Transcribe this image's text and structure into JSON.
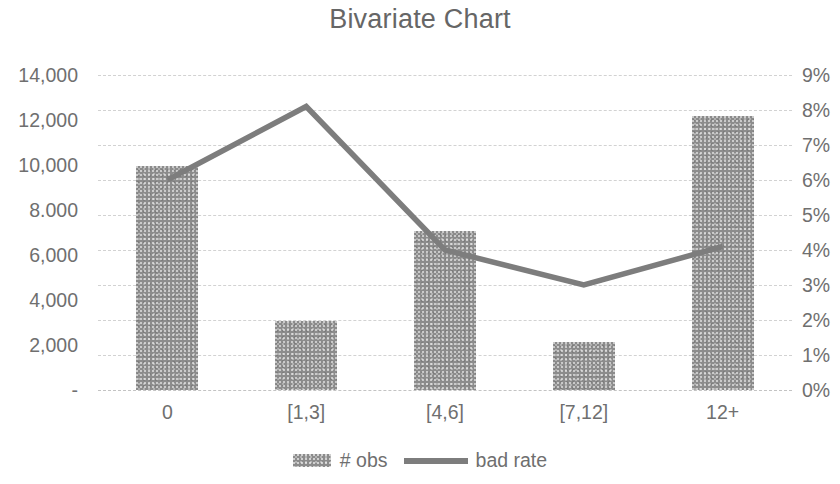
{
  "chart_data": {
    "type": "bar",
    "title": "Bivariate Chart",
    "xlabel": "",
    "ylabel": "",
    "categories": [
      "0",
      "[1,3]",
      "[4,6]",
      "[7,12]",
      "12+"
    ],
    "series": [
      {
        "name": "#  obs",
        "type": "bar",
        "axis": "left",
        "values": [
          9950,
          3050,
          7050,
          2150,
          12200
        ]
      },
      {
        "name": "bad rate",
        "type": "line",
        "axis": "right",
        "values": [
          0.06,
          0.081,
          0.04,
          0.03,
          0.041
        ]
      }
    ],
    "left_axis": {
      "ylim": [
        0,
        14000
      ],
      "tick_values": [
        14000,
        12000,
        10000,
        8000,
        6000,
        4000,
        2000,
        0
      ],
      "tick_labels": [
        "14,000",
        "12,000",
        "10,000",
        "8.000",
        "6,000",
        "4,000",
        "2,000",
        "-"
      ]
    },
    "right_axis": {
      "ylim": [
        0,
        0.09
      ],
      "tick_values": [
        0.09,
        0.08,
        0.07,
        0.06,
        0.05,
        0.04,
        0.03,
        0.02,
        0.01,
        0
      ],
      "tick_labels": [
        "9%",
        "8%",
        "7%",
        "6%",
        "5%",
        "4%",
        "3%",
        "2%",
        "1%",
        "0%"
      ]
    },
    "grid": true,
    "legend_position": "bottom",
    "legend": [
      {
        "label": "#  obs",
        "marker": "bar-swatch"
      },
      {
        "label": "bad rate",
        "marker": "line-swatch"
      }
    ],
    "colors": {
      "bar": "#8c8c8c",
      "line": "#7d7d7d",
      "text": "#6f6f6f",
      "grid": "#d2d2d2",
      "background": "#ffffff"
    }
  }
}
